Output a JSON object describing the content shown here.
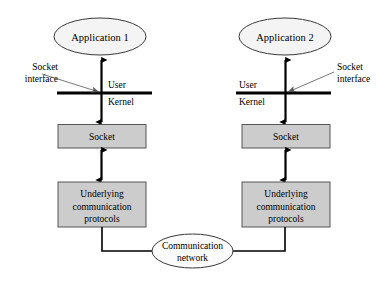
{
  "diagram": {
    "colors": {
      "box_fill": "#cccccc",
      "box_stroke": "#555555",
      "ellipse_fill": "#f4f4f4",
      "ellipse_stroke": "#3a3a3a",
      "line": "#000000",
      "background": "#ffffff"
    },
    "left": {
      "application": "Application 1",
      "socket": "Socket",
      "protocols_line1": "Underlying",
      "protocols_line2": "communication",
      "protocols_line3": "protocols",
      "socket_interface_line1": "Socket",
      "socket_interface_line2": "interface",
      "user": "User",
      "kernel": "Kernel"
    },
    "right": {
      "application": "Application 2",
      "socket": "Socket",
      "protocols_line1": "Underlying",
      "protocols_line2": "communication",
      "protocols_line3": "protocols",
      "socket_interface_line1": "Socket",
      "socket_interface_line2": "interface",
      "user": "User",
      "kernel": "Kernel"
    },
    "network": {
      "line1": "Communication",
      "line2": "network"
    }
  }
}
